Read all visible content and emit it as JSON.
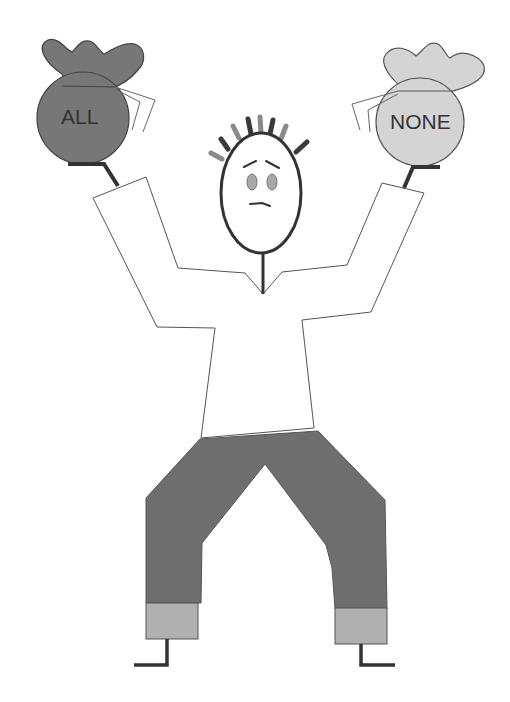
{
  "illustration": {
    "description": "Stick figure holding two money bags",
    "left_bag": {
      "label": "ALL",
      "color": "#777777"
    },
    "right_bag": {
      "label": "NONE",
      "color": "#d4d4d4"
    },
    "colors": {
      "outline": "#333333",
      "shirt": "#ffffff",
      "pants": "#6e6e6e",
      "cuffs": "#b0b0b0",
      "eyes": "#a8a8a8",
      "hair_dark": "#3a3a3a",
      "hair_light": "#8a8a8a"
    }
  }
}
